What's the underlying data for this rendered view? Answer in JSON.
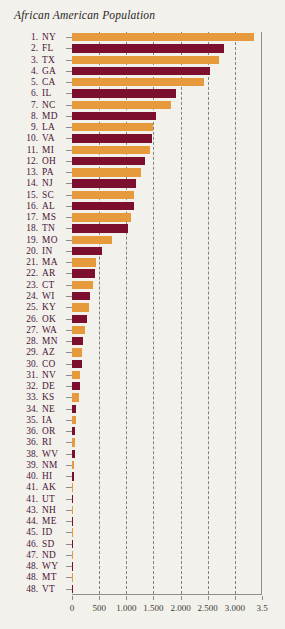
{
  "chart_data": {
    "type": "bar",
    "orientation": "horizontal",
    "title": "African American Population",
    "xlabel": "",
    "ylabel": "",
    "xlim": [
      0,
      3500
    ],
    "xticks": [
      0,
      500,
      1000,
      1500,
      2000,
      2500,
      3000,
      3500
    ],
    "xtick_labels": [
      "0",
      "500",
      "1.000",
      "1.500",
      "2.000",
      "2.500",
      "3.000",
      "3.5"
    ],
    "grid": true,
    "grid_style": "dashed-vertical",
    "legend": null,
    "bar_colors": [
      "#E79A3C",
      "#7C0F2E"
    ],
    "note": "Bars alternate orange and dark maroon by row. Values in thousands.",
    "categories": [
      "NY",
      "FL",
      "TX",
      "GA",
      "CA",
      "IL",
      "NC",
      "MD",
      "LA",
      "VA",
      "MI",
      "OH",
      "PA",
      "NJ",
      "SC",
      "AL",
      "MS",
      "TN",
      "MO",
      "IN",
      "MA",
      "AR",
      "CT",
      "WI",
      "KY",
      "OK",
      "WA",
      "MN",
      "AZ",
      "CO",
      "NV",
      "DE",
      "KS",
      "NE",
      "IA",
      "OR",
      "RI",
      "WV",
      "NM",
      "HI",
      "AK",
      "UT",
      "NH",
      "ME",
      "ID",
      "SD",
      "ND",
      "WY",
      "MT",
      "VT"
    ],
    "ranks": [
      "1.",
      "2.",
      "3.",
      "4.",
      "5.",
      "6.",
      "7.",
      "8.",
      "9.",
      "10.",
      "11.",
      "12.",
      "13.",
      "14.",
      "15.",
      "16.",
      "17.",
      "18.",
      "19.",
      "20.",
      "21.",
      "22.",
      "23.",
      "24.",
      "25.",
      "26.",
      "27.",
      "28.",
      "29.",
      "30.",
      "31.",
      "32.",
      "33.",
      "34.",
      "35.",
      "36.",
      "36.",
      "38.",
      "39.",
      "40.",
      "41.",
      "41.",
      "43.",
      "44.",
      "45.",
      "46.",
      "47.",
      "48.",
      "48.",
      "48."
    ],
    "values": [
      3360,
      2800,
      2700,
      2540,
      2430,
      1920,
      1830,
      1550,
      1490,
      1480,
      1430,
      1340,
      1280,
      1180,
      1150,
      1140,
      1080,
      1040,
      740,
      560,
      450,
      430,
      380,
      330,
      310,
      270,
      240,
      200,
      190,
      175,
      145,
      140,
      135,
      80,
      70,
      55,
      50,
      58,
      38,
      30,
      25,
      25,
      9,
      8,
      7,
      6,
      5,
      5,
      4,
      4
    ]
  },
  "axis": {
    "tick_0": "0",
    "tick_500": "500",
    "tick_1000": "1.000",
    "tick_1500": "1.500",
    "tick_2000": "2.000",
    "tick_2500": "2.500",
    "tick_3000": "3.000",
    "tick_3500": "3.5"
  }
}
